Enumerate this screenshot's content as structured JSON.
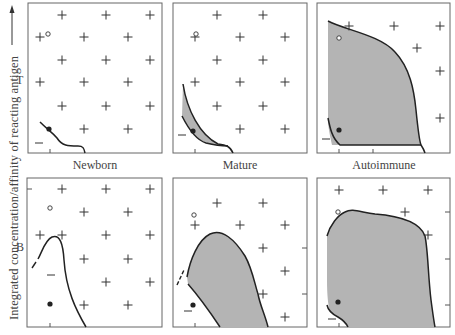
{
  "figure": {
    "y_axis_label": "Integrated concentration/affinity of reacting antigen",
    "y_axis_arrow": "arrow-up",
    "rows": [
      {
        "label": "T"
      },
      {
        "label": "B"
      }
    ],
    "columns": [
      {
        "label": "Newborn"
      },
      {
        "label": "Mature"
      },
      {
        "label": "Autoimmune"
      }
    ],
    "legend_symbols": {
      "open_circle": "open-circle",
      "filled_circle": "filled-circle",
      "plus": "plus-sign",
      "minus": "minus-sign"
    },
    "colors": {
      "line": "#222222",
      "fill": "#b4b4b4",
      "border": "#666666",
      "text": "#444444"
    }
  }
}
